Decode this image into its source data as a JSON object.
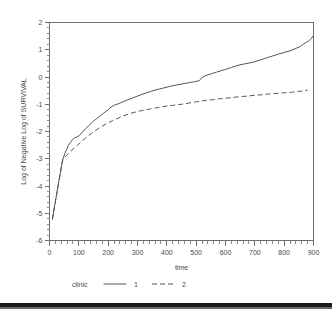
{
  "chart_data": {
    "type": "line",
    "title": "",
    "xlabel": "time",
    "ylabel": "Log of Negative Log of SURVIVAL",
    "xlim": [
      0,
      900
    ],
    "ylim": [
      -6,
      2
    ],
    "xticks": [
      0,
      100,
      200,
      300,
      400,
      500,
      600,
      700,
      800,
      900
    ],
    "xtick_labels": [
      "0",
      "100",
      "200",
      "300",
      "400",
      "500",
      "600",
      "700",
      "800",
      "900"
    ],
    "yticks": [
      2,
      1,
      0,
      -1,
      -2,
      -3,
      -4,
      -5,
      -6
    ],
    "ytick_labels": [
      "2",
      "1",
      "0",
      "-1",
      "-2",
      "-3",
      "-4",
      "-5",
      "-6"
    ],
    "grid": false,
    "minor_ticks": true,
    "legend": {
      "title": "clinic",
      "position": "bottom",
      "entries": [
        {
          "label": "1",
          "style": "solid",
          "color": "#555555"
        },
        {
          "label": "2",
          "style": "dashed",
          "color": "#555555"
        }
      ]
    },
    "series": [
      {
        "name": "1",
        "style": "solid",
        "color": "#555555",
        "x": [
          10,
          14,
          18,
          22,
          26,
          30,
          34,
          38,
          42,
          46,
          52,
          58,
          64,
          70,
          78,
          86,
          94,
          102,
          110,
          118,
          126,
          134,
          142,
          150,
          158,
          166,
          174,
          182,
          190,
          198,
          206,
          214,
          222,
          230,
          240,
          252,
          264,
          276,
          288,
          300,
          315,
          330,
          345,
          360,
          375,
          390,
          405,
          420,
          435,
          450,
          465,
          480,
          495,
          510,
          520,
          528,
          540,
          555,
          570,
          585,
          600,
          620,
          640,
          660,
          680,
          700,
          720,
          740,
          760,
          780,
          800,
          820,
          840,
          855,
          865,
          875,
          885,
          893,
          898
        ],
        "y": [
          -5.22,
          -4.95,
          -4.7,
          -4.45,
          -4.2,
          -3.95,
          -3.7,
          -3.45,
          -3.2,
          -3.0,
          -2.82,
          -2.67,
          -2.52,
          -2.42,
          -2.3,
          -2.23,
          -2.2,
          -2.15,
          -2.05,
          -1.95,
          -1.87,
          -1.78,
          -1.7,
          -1.62,
          -1.55,
          -1.48,
          -1.42,
          -1.35,
          -1.28,
          -1.22,
          -1.14,
          -1.08,
          -1.03,
          -1.0,
          -0.96,
          -0.9,
          -0.85,
          -0.8,
          -0.75,
          -0.7,
          -0.64,
          -0.58,
          -0.53,
          -0.48,
          -0.44,
          -0.4,
          -0.36,
          -0.32,
          -0.29,
          -0.26,
          -0.23,
          -0.2,
          -0.17,
          -0.14,
          -0.02,
          0.03,
          0.08,
          0.13,
          0.18,
          0.23,
          0.28,
          0.35,
          0.42,
          0.47,
          0.51,
          0.56,
          0.63,
          0.7,
          0.77,
          0.84,
          0.9,
          0.96,
          1.05,
          1.12,
          1.2,
          1.27,
          1.33,
          1.42,
          1.5
        ]
      },
      {
        "name": "2",
        "style": "dashed",
        "color": "#555555",
        "x": [
          10,
          14,
          18,
          22,
          26,
          30,
          34,
          38,
          42,
          46,
          52,
          58,
          64,
          72,
          80,
          90,
          100,
          110,
          120,
          132,
          144,
          156,
          168,
          180,
          192,
          204,
          216,
          228,
          240,
          252,
          264,
          276,
          288,
          300,
          315,
          330,
          345,
          360,
          375,
          390,
          405,
          420,
          435,
          450,
          465,
          475,
          485,
          500,
          520,
          540,
          560,
          580,
          600,
          625,
          650,
          675,
          700,
          725,
          750,
          775,
          800,
          825,
          850,
          870,
          880
        ],
        "y": [
          -5.22,
          -4.95,
          -4.7,
          -4.45,
          -4.2,
          -3.95,
          -3.7,
          -3.45,
          -3.2,
          -3.02,
          -2.95,
          -2.88,
          -2.82,
          -2.73,
          -2.65,
          -2.55,
          -2.46,
          -2.36,
          -2.27,
          -2.16,
          -2.06,
          -1.97,
          -1.88,
          -1.8,
          -1.73,
          -1.66,
          -1.6,
          -1.54,
          -1.48,
          -1.43,
          -1.38,
          -1.34,
          -1.3,
          -1.27,
          -1.23,
          -1.2,
          -1.17,
          -1.14,
          -1.11,
          -1.08,
          -1.06,
          -1.04,
          -1.02,
          -1.0,
          -0.98,
          -0.96,
          -0.93,
          -0.91,
          -0.88,
          -0.85,
          -0.83,
          -0.8,
          -0.78,
          -0.75,
          -0.72,
          -0.7,
          -0.67,
          -0.65,
          -0.62,
          -0.6,
          -0.58,
          -0.56,
          -0.53,
          -0.5,
          -0.48
        ]
      }
    ]
  }
}
